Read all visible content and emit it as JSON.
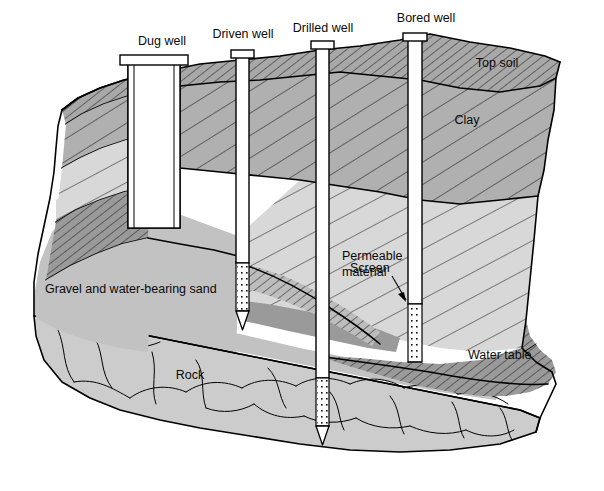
{
  "figure": {
    "background_color": "#ffffff",
    "width": 604,
    "height": 491
  },
  "well_labels": [
    {
      "id": "dug-well",
      "text": "Dug well",
      "x": 162,
      "y": 45,
      "anchor": "middle"
    },
    {
      "id": "driven-well",
      "text": "Driven well",
      "x": 243,
      "y": 38,
      "anchor": "middle"
    },
    {
      "id": "drilled-well",
      "text": "Drilled well",
      "x": 323,
      "y": 32,
      "anchor": "middle"
    },
    {
      "id": "bored-well",
      "text": "Bored well",
      "x": 426,
      "y": 22,
      "anchor": "middle"
    }
  ],
  "layer_labels": [
    {
      "id": "top-soil",
      "text": "Top soil",
      "x": 497,
      "y": 67,
      "anchor": "middle"
    },
    {
      "id": "clay",
      "text": "Clay",
      "x": 467,
      "y": 124,
      "anchor": "middle"
    },
    {
      "id": "permeable-line-1",
      "text": "Permeable",
      "x": 342,
      "y": 260,
      "anchor": "start"
    },
    {
      "id": "permeable-line-2",
      "text": "material",
      "x": 342,
      "y": 276,
      "anchor": "start"
    },
    {
      "id": "screen",
      "text": "Screen",
      "x": 354,
      "y": 272,
      "anchor": "start"
    },
    {
      "id": "gravel-sand",
      "text": "Gravel and water-bearing sand",
      "x": 45,
      "y": 293,
      "anchor": "start"
    },
    {
      "id": "rock",
      "text": "Rock",
      "x": 190,
      "y": 379,
      "anchor": "middle"
    },
    {
      "id": "water-table",
      "text": "Water table",
      "x": 468,
      "y": 359,
      "anchor": "start"
    }
  ],
  "layers": [
    {
      "id": "top-soil",
      "name": "Top soil",
      "fill": "#a8a8a8",
      "pattern": "dense-diagonal-hatch"
    },
    {
      "id": "clay",
      "name": "Clay",
      "fill": "#b0b0b0",
      "pattern": "wide-diagonal-hatch"
    },
    {
      "id": "permeable",
      "name": "Permeable material",
      "fill": "#d8d8d8",
      "pattern": "sparse-diagonal-hatch"
    },
    {
      "id": "confining",
      "name": "Confining layer",
      "fill": "#9a9a9a",
      "pattern": "dense-diagonal-hatch"
    },
    {
      "id": "gravel",
      "name": "Gravel and water-bearing sand",
      "fill": "#c2c2c2",
      "pattern": "none"
    },
    {
      "id": "rock",
      "name": "Rock",
      "fill": "#cccccc",
      "pattern": "fracture-lines"
    }
  ],
  "wells": [
    {
      "id": "dug-well",
      "name": "Dug well",
      "type": "dug",
      "casing_fill": "#ffffff",
      "water_fill": "#8f8f8f",
      "has_water": true,
      "has_cap": true,
      "has_screen": false,
      "has_point": false
    },
    {
      "id": "driven-well",
      "name": "Driven well",
      "type": "driven",
      "casing_fill": "#ffffff",
      "has_water": false,
      "has_cap": true,
      "has_screen": true,
      "has_point": true
    },
    {
      "id": "drilled-well",
      "name": "Drilled well",
      "type": "drilled",
      "casing_fill": "#ffffff",
      "has_water": false,
      "has_cap": true,
      "has_screen": true,
      "has_point": true
    },
    {
      "id": "bored-well",
      "name": "Bored well",
      "type": "bored",
      "casing_fill": "#ffffff",
      "has_water": false,
      "has_cap": true,
      "has_screen": true,
      "has_point": false
    }
  ],
  "colors": {
    "outline": "#000000",
    "text": "#0a0a0a",
    "background": "#ffffff",
    "top_soil": "#a8a8a8",
    "clay": "#b0b0b0",
    "permeable": "#d8d8d8",
    "confining": "#9a9a9a",
    "gravel": "#c2c2c2",
    "rock": "#cccccc",
    "well_water": "#8f8f8f"
  }
}
